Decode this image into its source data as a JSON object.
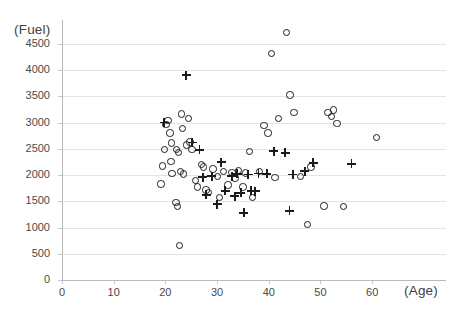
{
  "chart_data": {
    "type": "scatter",
    "title": "",
    "subtitle": "",
    "xlabel": "(Age)",
    "ylabel": "(Fuel)",
    "xlim": [
      0,
      65
    ],
    "ylim": [
      0,
      4800
    ],
    "xticks": [
      0,
      10,
      20,
      30,
      40,
      50,
      60
    ],
    "yticks": [
      0,
      500,
      1000,
      1500,
      2000,
      2500,
      3000,
      3500,
      4000,
      4500
    ],
    "xtick_labels": [
      "0",
      "10",
      "20",
      "30",
      "40",
      "50",
      "60"
    ],
    "ytick_labels": [
      "0",
      "500",
      "1000",
      "1500",
      "2000",
      "2500",
      "3000",
      "3500",
      "4000",
      "4500"
    ],
    "grid": "horizontal",
    "legend": "none",
    "legend_position": "none",
    "marker_color": "#1b1b1b",
    "grid_color": "#e4e4e4",
    "series": [
      {
        "name": "circle",
        "marker": "circle",
        "points": [
          [
            20.2,
            2950
          ],
          [
            20.6,
            3030
          ],
          [
            21.0,
            2790
          ],
          [
            21.3,
            2600
          ],
          [
            20.0,
            2480
          ],
          [
            19.6,
            2160
          ],
          [
            21.2,
            2250
          ],
          [
            21.4,
            2020
          ],
          [
            19.3,
            1820
          ],
          [
            22.3,
            2480
          ],
          [
            22.6,
            2420
          ],
          [
            23.2,
            3150
          ],
          [
            23.4,
            2870
          ],
          [
            23.1,
            2060
          ],
          [
            23.6,
            2010
          ],
          [
            24.2,
            2560
          ],
          [
            24.6,
            3060
          ],
          [
            24.9,
            2620
          ],
          [
            25.3,
            2480
          ],
          [
            22.2,
            1470
          ],
          [
            22.5,
            1390
          ],
          [
            22.8,
            650
          ],
          [
            26.0,
            1880
          ],
          [
            26.3,
            1760
          ],
          [
            27.1,
            2190
          ],
          [
            27.5,
            2140
          ],
          [
            28.0,
            1700
          ],
          [
            28.4,
            1660
          ],
          [
            29.3,
            2100
          ],
          [
            30.2,
            1960
          ],
          [
            30.6,
            1560
          ],
          [
            31.4,
            2060
          ],
          [
            32.2,
            1800
          ],
          [
            33.0,
            2040
          ],
          [
            33.6,
            1930
          ],
          [
            34.3,
            2070
          ],
          [
            35.1,
            1760
          ],
          [
            35.6,
            2030
          ],
          [
            36.4,
            2440
          ],
          [
            37.0,
            1560
          ],
          [
            38.3,
            2060
          ],
          [
            39.2,
            2930
          ],
          [
            40.0,
            2790
          ],
          [
            40.6,
            4300
          ],
          [
            41.3,
            1940
          ],
          [
            42.0,
            3060
          ],
          [
            43.6,
            4700
          ],
          [
            44.2,
            3510
          ],
          [
            45.0,
            3180
          ],
          [
            46.2,
            1960
          ],
          [
            47.6,
            1050
          ],
          [
            48.3,
            2140
          ],
          [
            51.6,
            3180
          ],
          [
            52.2,
            3100
          ],
          [
            52.6,
            3230
          ],
          [
            53.3,
            2970
          ],
          [
            50.8,
            1400
          ],
          [
            54.6,
            1390
          ],
          [
            61.0,
            2700
          ]
        ]
      },
      {
        "name": "plus",
        "marker": "plus",
        "points": [
          [
            19.8,
            3000
          ],
          [
            24.0,
            3900
          ],
          [
            25.2,
            2620
          ],
          [
            26.6,
            2480
          ],
          [
            27.2,
            1960
          ],
          [
            27.9,
            1620
          ],
          [
            29.0,
            1980
          ],
          [
            30.0,
            1440
          ],
          [
            30.8,
            2240
          ],
          [
            31.6,
            1700
          ],
          [
            32.8,
            1980
          ],
          [
            33.4,
            1600
          ],
          [
            33.9,
            2020
          ],
          [
            34.6,
            1660
          ],
          [
            35.2,
            1280
          ],
          [
            36.0,
            2010
          ],
          [
            36.6,
            1700
          ],
          [
            37.4,
            1690
          ],
          [
            38.0,
            2030
          ],
          [
            39.6,
            2020
          ],
          [
            41.0,
            2450
          ],
          [
            43.2,
            2420
          ],
          [
            44.0,
            1320
          ],
          [
            44.6,
            2010
          ],
          [
            47.0,
            2070
          ],
          [
            48.6,
            2230
          ],
          [
            56.0,
            2210
          ]
        ]
      }
    ]
  }
}
